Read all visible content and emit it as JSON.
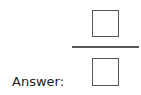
{
  "answer": {
    "label": "Answer:",
    "fraction": {
      "numerator": "",
      "denominator": ""
    }
  }
}
